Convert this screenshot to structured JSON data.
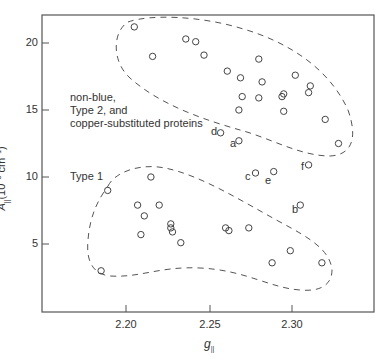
{
  "chart_data": {
    "type": "scatter",
    "title": "",
    "xlabel": "g∥",
    "ylabel": "A∥ (10⁻³ cm⁻¹)",
    "xlim": [
      2.15,
      2.35
    ],
    "ylim": [
      0,
      22
    ],
    "x_ticks": [
      "2.20",
      "2.25",
      "2.30"
    ],
    "y_ticks": [
      "5",
      "10",
      "15",
      "20"
    ],
    "grid": false,
    "legend": null,
    "annotations": [
      {
        "text": "non-blue,\nType 2, and\ncopper-substituted proteins",
        "region": "upper cluster"
      },
      {
        "text": "Type 1",
        "region": "lower cluster"
      },
      {
        "text": "a",
        "x": 2.268,
        "y": 12.7
      },
      {
        "text": "b",
        "x": 2.305,
        "y": 7.9
      },
      {
        "text": "c",
        "x": 2.278,
        "y": 10.3
      },
      {
        "text": "d",
        "x": 2.257,
        "y": 13.3
      },
      {
        "text": "e",
        "x": 2.289,
        "y": 10.4
      },
      {
        "text": "f",
        "x": 2.31,
        "y": 10.9
      }
    ],
    "series": [
      {
        "name": "non-blue, Type 2, and copper-substituted proteins",
        "points": [
          [
            2.205,
            21.2
          ],
          [
            2.236,
            20.3
          ],
          [
            2.242,
            20.1
          ],
          [
            2.216,
            19.0
          ],
          [
            2.247,
            19.1
          ],
          [
            2.28,
            18.8
          ],
          [
            2.261,
            17.9
          ],
          [
            2.269,
            17.4
          ],
          [
            2.282,
            17.1
          ],
          [
            2.302,
            17.6
          ],
          [
            2.311,
            16.8
          ],
          [
            2.31,
            16.3
          ],
          [
            2.27,
            16.0
          ],
          [
            2.28,
            15.9
          ],
          [
            2.294,
            16.0
          ],
          [
            2.295,
            16.2
          ],
          [
            2.268,
            15.0
          ],
          [
            2.295,
            14.9
          ],
          [
            2.32,
            14.3
          ],
          [
            2.328,
            12.5
          ],
          [
            2.257,
            13.3
          ],
          [
            2.268,
            12.7
          ]
        ]
      },
      {
        "name": "Type 1",
        "points": [
          [
            2.189,
            9.0
          ],
          [
            2.215,
            10.0
          ],
          [
            2.207,
            7.9
          ],
          [
            2.211,
            7.1
          ],
          [
            2.22,
            7.9
          ],
          [
            2.209,
            5.7
          ],
          [
            2.227,
            6.5
          ],
          [
            2.227,
            6.2
          ],
          [
            2.228,
            5.9
          ],
          [
            2.233,
            5.1
          ],
          [
            2.185,
            3.0
          ],
          [
            2.26,
            6.2
          ],
          [
            2.262,
            6.0
          ],
          [
            2.274,
            6.2
          ],
          [
            2.299,
            4.5
          ],
          [
            2.288,
            3.6
          ],
          [
            2.318,
            3.6
          ],
          [
            2.278,
            10.3
          ],
          [
            2.289,
            10.4
          ],
          [
            2.31,
            10.9
          ],
          [
            2.305,
            7.9
          ]
        ]
      }
    ]
  },
  "axes": {
    "xlabel_main": "g",
    "xlabel_sub": "||",
    "ylabel_main": "A",
    "ylabel_sub": "||",
    "ylabel_units": "(10",
    "ylabel_exp": "−3",
    "ylabel_units2": " cm",
    "ylabel_exp2": "−1",
    "ylabel_close": ")"
  },
  "labels": {
    "upper_line1": "non-blue,",
    "upper_line2": "Type 2, and",
    "upper_line3": "copper-substituted proteins",
    "lower": "Type 1",
    "a": "a",
    "b": "b",
    "c": "c",
    "d": "d",
    "e": "e",
    "f": "f"
  },
  "ticks": {
    "y": [
      "20",
      "15",
      "10",
      "5"
    ],
    "x": [
      "2.20",
      "2.25",
      "2.30"
    ]
  }
}
